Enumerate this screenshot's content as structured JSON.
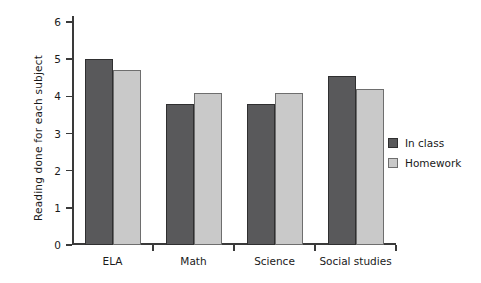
{
  "chart_data": {
    "type": "bar",
    "title": "",
    "subtitle": "",
    "xlabel": "",
    "ylabel": "Reading done for each subject",
    "categories": [
      "ELA",
      "Math",
      "Science",
      "Social studies"
    ],
    "series": [
      {
        "name": "In class",
        "color": "#59595b",
        "values": [
          5.0,
          3.8,
          3.8,
          4.55
        ]
      },
      {
        "name": "Homework",
        "color": "#c9c9c9",
        "values": [
          4.7,
          4.1,
          4.1,
          4.2
        ]
      }
    ],
    "ylim": [
      0,
      6
    ],
    "ytick_labels": [
      "0",
      "1",
      "2",
      "3",
      "4",
      "5",
      "6"
    ],
    "ytick_values": [
      0,
      1,
      2,
      3,
      4,
      5,
      6
    ],
    "grid": false,
    "legend_position": "right"
  },
  "legend": {
    "items": [
      {
        "label": "In class"
      },
      {
        "label": "Homework"
      }
    ]
  }
}
